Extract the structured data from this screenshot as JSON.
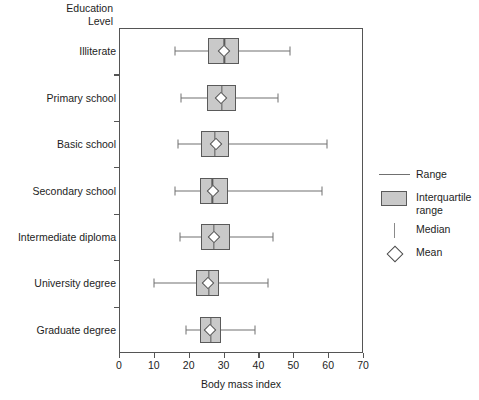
{
  "chart_data": {
    "type": "box",
    "title": "",
    "ylabel": "Education\nLevel",
    "xlabel": "Body mass index",
    "xlim": [
      0,
      70
    ],
    "xticks": [
      0,
      10,
      20,
      30,
      40,
      50,
      60,
      70
    ],
    "grid": false,
    "categories": [
      "Illiterate",
      "Primary school",
      "Basic school",
      "Secondary school",
      "Intermediate diploma",
      "University degree",
      "Graduate degree"
    ],
    "boxes": [
      {
        "category": "Illiterate",
        "min": 16.0,
        "q1": 25.5,
        "median": 30.2,
        "q3": 34.5,
        "max": 49.0,
        "mean": 30.0
      },
      {
        "category": "Primary school",
        "min": 17.8,
        "q1": 25.2,
        "median": 29.5,
        "q3": 33.5,
        "max": 45.5,
        "mean": 29.3
      },
      {
        "category": "Basic school",
        "min": 17.0,
        "q1": 23.5,
        "median": 27.5,
        "q3": 31.5,
        "max": 59.8,
        "mean": 27.7
      },
      {
        "category": "Secondary school",
        "min": 16.2,
        "q1": 23.2,
        "median": 26.8,
        "q3": 31.3,
        "max": 58.2,
        "mean": 27.0
      },
      {
        "category": "Intermediate diploma",
        "min": 17.5,
        "q1": 23.5,
        "median": 27.3,
        "q3": 31.8,
        "max": 44.2,
        "mean": 27.3
      },
      {
        "category": "University degree",
        "min": 10.0,
        "q1": 22.2,
        "median": 25.8,
        "q3": 28.7,
        "max": 42.8,
        "mean": 25.5
      },
      {
        "category": "Graduate degree",
        "min": 19.2,
        "q1": 23.2,
        "median": 26.3,
        "q3": 29.3,
        "max": 39.0,
        "mean": 26.0
      }
    ],
    "legend": {
      "position": "right",
      "entries": [
        {
          "key": "range-line",
          "label": "Range"
        },
        {
          "key": "iqr-box",
          "label": "Interquartile range"
        },
        {
          "key": "median-line",
          "label": "Median"
        },
        {
          "key": "mean-diamond",
          "label": "Mean"
        }
      ]
    },
    "colors": {
      "box_fill": "#c9c9c9",
      "box_border": "#5a5a5a",
      "whisker": "#707070",
      "axis": "#555555",
      "text": "#1d1d1d"
    }
  }
}
